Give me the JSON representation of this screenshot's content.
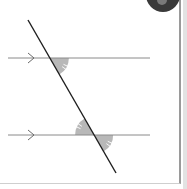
{
  "diagram": {
    "parallel_lines": [
      {
        "name": "upper-parallel-line",
        "marker": "single-arrow-right"
      },
      {
        "name": "lower-parallel-line",
        "marker": "single-arrow-right"
      }
    ],
    "transversal": {
      "name": "transversal-line"
    },
    "marked_angles": [
      {
        "name": "upper-angle-below-right",
        "tick_marks": 2,
        "shaded": true
      },
      {
        "name": "lower-angle-above-left",
        "tick_marks": 2,
        "shaded": true
      },
      {
        "name": "lower-angle-below-right",
        "tick_marks": 2,
        "shaded": true
      }
    ],
    "colors": {
      "shading": "#b8b8b8",
      "transversal": "#1e1e1e",
      "parallel": "#8a8a8a",
      "badge": "#3a3a3a"
    }
  },
  "corner_badge": {
    "icon": "disc-icon"
  }
}
